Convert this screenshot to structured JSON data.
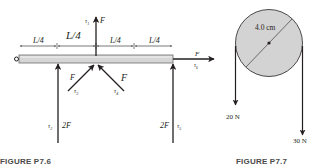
{
  "figures": [
    {
      "caption": "FIGURE P7.6",
      "dimension_labels": [
        "L/4",
        "L/4",
        "L/4",
        "L/4"
      ],
      "forces": [
        {
          "torque": "τ",
          "sub": "1",
          "magnitude": "F",
          "direction": "up"
        },
        {
          "torque": "τ",
          "sub": "2",
          "magnitude": "2F",
          "direction": "up"
        },
        {
          "torque": "τ",
          "sub": "3",
          "magnitude": "F",
          "direction": "up-right"
        },
        {
          "torque": "τ",
          "sub": "4",
          "magnitude": "F",
          "direction": "up-left"
        },
        {
          "torque": "τ",
          "sub": "5",
          "magnitude": "2F",
          "direction": "up"
        },
        {
          "torque": "τ",
          "sub": "6",
          "magnitude": "F",
          "direction": "right"
        }
      ],
      "colors": {
        "beam_fill": "#d6d6d6",
        "beam_stroke": "#6b6b6b",
        "ink": "#231f20"
      }
    },
    {
      "caption": "FIGURE P7.7",
      "diameter_label": "4.0 cm",
      "left_force": "20 N",
      "right_force": "30 N",
      "colors": {
        "disk_fill": "#d3d3d3",
        "ink": "#231f20"
      }
    }
  ]
}
